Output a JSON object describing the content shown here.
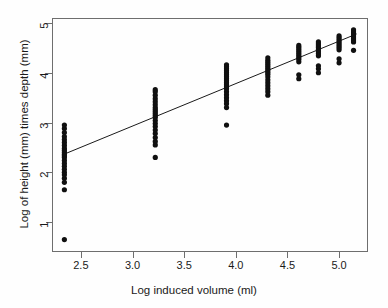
{
  "chart_data": {
    "type": "scatter",
    "title": "",
    "xlabel": "Log induced volume (ml)",
    "ylabel": "Log of height (mm) times depth (mm)",
    "xlim": [
      2.22,
      5.28
    ],
    "ylim": [
      0.4,
      5.1
    ],
    "xticks": [
      2.5,
      3.0,
      3.5,
      4.0,
      4.5,
      5.0
    ],
    "xtick_labels": [
      "2.5",
      "3.0",
      "3.5",
      "4.0",
      "4.5",
      "5.0"
    ],
    "yticks": [
      1,
      2,
      3,
      4,
      5
    ],
    "ytick_labels": [
      "1",
      "2",
      "3",
      "4",
      "5"
    ],
    "grid": false,
    "legend": null,
    "marker": "filled-circle",
    "marker_color": "#101010",
    "marker_size": 2.6,
    "series": [
      {
        "name": "observations",
        "points": [
          [
            2.34,
            0.65
          ],
          [
            2.34,
            1.65
          ],
          [
            2.34,
            1.8
          ],
          [
            2.34,
            1.88
          ],
          [
            2.34,
            1.95
          ],
          [
            2.34,
            2.0
          ],
          [
            2.34,
            2.06
          ],
          [
            2.34,
            2.12
          ],
          [
            2.34,
            2.18
          ],
          [
            2.34,
            2.24
          ],
          [
            2.34,
            2.3
          ],
          [
            2.34,
            2.33
          ],
          [
            2.34,
            2.36
          ],
          [
            2.34,
            2.4
          ],
          [
            2.34,
            2.44
          ],
          [
            2.34,
            2.48
          ],
          [
            2.34,
            2.54
          ],
          [
            2.34,
            2.6
          ],
          [
            2.34,
            2.66
          ],
          [
            2.34,
            2.72
          ],
          [
            2.34,
            2.8
          ],
          [
            2.34,
            2.88
          ],
          [
            2.34,
            2.95
          ],
          [
            3.22,
            2.3
          ],
          [
            3.22,
            2.55
          ],
          [
            3.22,
            2.62
          ],
          [
            3.22,
            2.7
          ],
          [
            3.22,
            2.78
          ],
          [
            3.22,
            2.85
          ],
          [
            3.22,
            2.92
          ],
          [
            3.22,
            2.98
          ],
          [
            3.22,
            3.04
          ],
          [
            3.22,
            3.1
          ],
          [
            3.22,
            3.14
          ],
          [
            3.22,
            3.18
          ],
          [
            3.22,
            3.22
          ],
          [
            3.22,
            3.26
          ],
          [
            3.22,
            3.3
          ],
          [
            3.22,
            3.36
          ],
          [
            3.22,
            3.42
          ],
          [
            3.22,
            3.48
          ],
          [
            3.22,
            3.55
          ],
          [
            3.22,
            3.62
          ],
          [
            3.22,
            3.66
          ],
          [
            3.91,
            2.95
          ],
          [
            3.91,
            3.3
          ],
          [
            3.91,
            3.38
          ],
          [
            3.91,
            3.44
          ],
          [
            3.91,
            3.5
          ],
          [
            3.91,
            3.56
          ],
          [
            3.91,
            3.62
          ],
          [
            3.91,
            3.68
          ],
          [
            3.91,
            3.72
          ],
          [
            3.91,
            3.76
          ],
          [
            3.91,
            3.8
          ],
          [
            3.91,
            3.84
          ],
          [
            3.91,
            3.88
          ],
          [
            3.91,
            3.92
          ],
          [
            3.91,
            3.96
          ],
          [
            3.91,
            4.0
          ],
          [
            3.91,
            4.04
          ],
          [
            3.91,
            4.08
          ],
          [
            3.91,
            4.12
          ],
          [
            3.91,
            4.16
          ],
          [
            4.31,
            3.55
          ],
          [
            4.31,
            3.62
          ],
          [
            4.31,
            3.68
          ],
          [
            4.31,
            3.74
          ],
          [
            4.31,
            3.8
          ],
          [
            4.31,
            3.86
          ],
          [
            4.31,
            3.92
          ],
          [
            4.31,
            3.97
          ],
          [
            4.31,
            4.01
          ],
          [
            4.31,
            4.05
          ],
          [
            4.31,
            4.09
          ],
          [
            4.31,
            4.13
          ],
          [
            4.31,
            4.17
          ],
          [
            4.31,
            4.21
          ],
          [
            4.31,
            4.25
          ],
          [
            4.31,
            4.3
          ],
          [
            4.61,
            3.88
          ],
          [
            4.61,
            3.96
          ],
          [
            4.61,
            4.22
          ],
          [
            4.61,
            4.27
          ],
          [
            4.61,
            4.31
          ],
          [
            4.61,
            4.35
          ],
          [
            4.61,
            4.39
          ],
          [
            4.61,
            4.43
          ],
          [
            4.61,
            4.47
          ],
          [
            4.61,
            4.51
          ],
          [
            4.61,
            4.55
          ],
          [
            4.8,
            4.0
          ],
          [
            4.8,
            4.08
          ],
          [
            4.8,
            4.14
          ],
          [
            4.8,
            4.34
          ],
          [
            4.8,
            4.38
          ],
          [
            4.8,
            4.42
          ],
          [
            4.8,
            4.46
          ],
          [
            4.8,
            4.5
          ],
          [
            4.8,
            4.54
          ],
          [
            4.8,
            4.58
          ],
          [
            4.8,
            4.62
          ],
          [
            5.0,
            4.2
          ],
          [
            5.0,
            4.28
          ],
          [
            5.0,
            4.46
          ],
          [
            5.0,
            4.5
          ],
          [
            5.0,
            4.54
          ],
          [
            5.0,
            4.58
          ],
          [
            5.0,
            4.62
          ],
          [
            5.0,
            4.66
          ],
          [
            5.0,
            4.7
          ],
          [
            5.0,
            4.74
          ],
          [
            5.14,
            4.45
          ],
          [
            5.14,
            4.62
          ],
          [
            5.14,
            4.66
          ],
          [
            5.14,
            4.7
          ],
          [
            5.14,
            4.74
          ],
          [
            5.14,
            4.78
          ],
          [
            5.14,
            4.82
          ],
          [
            5.14,
            4.86
          ]
        ]
      }
    ],
    "fit_line": {
      "name": "regression-line",
      "color": "#1a1a1a",
      "x_start": 2.32,
      "y_start": 2.35,
      "x_end": 5.17,
      "y_end": 4.78
    }
  }
}
